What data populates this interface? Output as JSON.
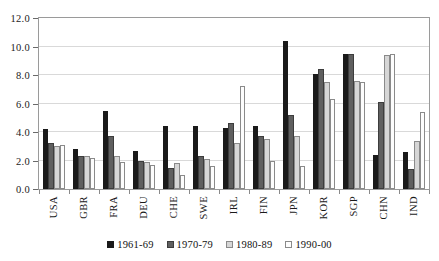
{
  "chart_data": {
    "type": "bar",
    "title": "",
    "subtitle": "",
    "xlabel": "",
    "ylabel": "",
    "ylim": [
      0,
      12
    ],
    "ytick_values": [
      12.0,
      10.0,
      8.0,
      6.0,
      4.0,
      2.0,
      0.0
    ],
    "ytick_labels": [
      "12.0",
      "10.0",
      "8.0",
      "6.0",
      "4.0",
      "2.0",
      "0.0"
    ],
    "grid": true,
    "legend_position": "bottom",
    "categories": [
      "USA",
      "GBR",
      "FRA",
      "DEU",
      "CHE",
      "SWE",
      "IRL",
      "FIN",
      "JPN",
      "KOR",
      "SGP",
      "CHN",
      "IND"
    ],
    "series": [
      {
        "name": "1961-69",
        "color": "#1a1a1a",
        "values": [
          4.2,
          2.8,
          5.5,
          2.7,
          4.4,
          4.4,
          4.3,
          4.4,
          10.4,
          8.1,
          9.5,
          2.4,
          2.6
        ]
      },
      {
        "name": "1970-79",
        "color": "#5f5f5f",
        "values": [
          3.2,
          2.3,
          3.7,
          2.0,
          1.5,
          2.3,
          4.6,
          3.7,
          5.2,
          8.4,
          9.5,
          6.1,
          1.4
        ]
      },
      {
        "name": "1980-89",
        "color": "#d6d6d6",
        "values": [
          3.0,
          2.3,
          2.3,
          1.9,
          1.8,
          2.1,
          3.2,
          3.5,
          3.7,
          7.5,
          7.6,
          9.4,
          3.4
        ]
      },
      {
        "name": "1990-00",
        "color": "#fdfdfd",
        "values": [
          3.1,
          2.2,
          1.9,
          1.7,
          1.0,
          1.6,
          7.2,
          2.0,
          1.6,
          6.3,
          7.5,
          9.5,
          5.4
        ]
      }
    ]
  },
  "legend": {
    "items": [
      {
        "label": "1961-69"
      },
      {
        "label": "1970-79"
      },
      {
        "label": "1980-89"
      },
      {
        "label": "1990-00"
      }
    ]
  }
}
